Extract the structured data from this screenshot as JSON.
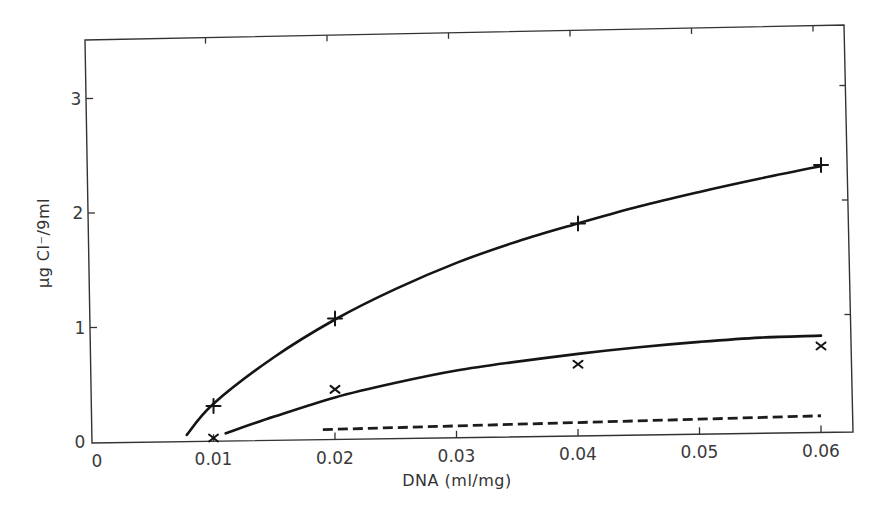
{
  "chart_data": {
    "type": "line",
    "title": "",
    "xlabel": "DNA (ml/mg)",
    "ylabel": "μg Cl⁻/9ml",
    "xlim": [
      0,
      0.063
    ],
    "ylim": [
      0,
      3.5
    ],
    "x_ticks": [
      0,
      0.01,
      0.02,
      0.03,
      0.04,
      0.05,
      0.06
    ],
    "x_tick_labels": [
      "0",
      "0.01",
      "0.02",
      "0.03",
      "0.04",
      "0.05",
      "0.06"
    ],
    "y_ticks": [
      0,
      1,
      2,
      3
    ],
    "y_tick_labels": [
      "0",
      "1",
      "2",
      "3"
    ],
    "grid": false,
    "legend": null,
    "series": [
      {
        "name": "plus-markers",
        "marker": "+",
        "x": [
          0.01,
          0.02,
          0.04,
          0.06
        ],
        "values": [
          0.3,
          1.05,
          1.85,
          2.33
        ],
        "fit_curve": {
          "style": "solid",
          "x": [
            0.0078,
            0.01,
            0.015,
            0.02,
            0.025,
            0.03,
            0.035,
            0.04,
            0.045,
            0.05,
            0.055,
            0.06
          ],
          "y": [
            0.05,
            0.32,
            0.72,
            1.04,
            1.3,
            1.52,
            1.7,
            1.85,
            1.99,
            2.11,
            2.22,
            2.32
          ]
        }
      },
      {
        "name": "cross-markers",
        "marker": "x",
        "x": [
          0.01,
          0.02,
          0.04,
          0.06
        ],
        "values": [
          0.02,
          0.43,
          0.62,
          0.75
        ],
        "fit_curve": {
          "style": "solid",
          "x": [
            0.011,
            0.015,
            0.02,
            0.025,
            0.03,
            0.035,
            0.04,
            0.045,
            0.05,
            0.055,
            0.06
          ],
          "y": [
            0.06,
            0.2,
            0.36,
            0.48,
            0.58,
            0.65,
            0.71,
            0.76,
            0.8,
            0.83,
            0.84
          ]
        }
      },
      {
        "name": "dashed-baseline",
        "marker": null,
        "style": "dashed",
        "x": [
          0.019,
          0.06
        ],
        "values": [
          0.08,
          0.14
        ]
      }
    ]
  },
  "axes": {
    "x_label": "DNA (ml/mg)",
    "y_label": "μg Cl⁻/9ml",
    "x_tick_labels": [
      "0",
      "0.01",
      "0.02",
      "0.03",
      "0.04",
      "0.05",
      "0.06"
    ],
    "y_tick_labels": [
      "0",
      "1",
      "2",
      "3"
    ]
  }
}
